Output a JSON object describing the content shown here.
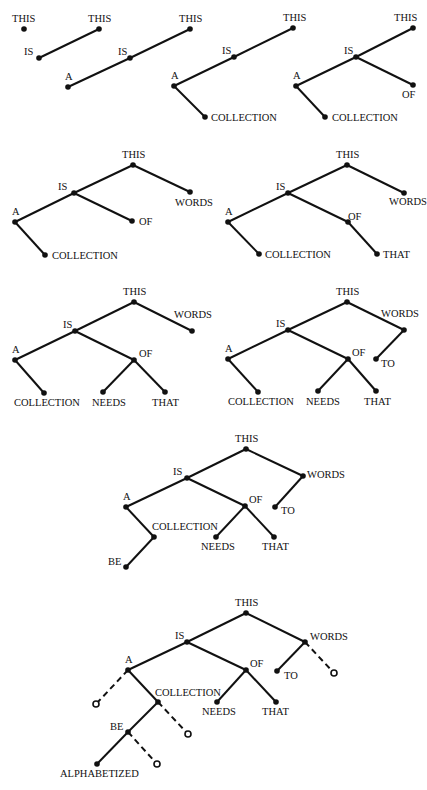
{
  "figure": {
    "trees": [
      {
        "nodes": [
          {
            "id": "THIS",
            "label": "THIS",
            "x": 24,
            "y": 29,
            "lx": 12,
            "ly": 22
          }
        ],
        "edges": []
      },
      {
        "nodes": [
          {
            "id": "THIS",
            "label": "THIS",
            "x": 99,
            "y": 29,
            "lx": 88,
            "ly": 22
          },
          {
            "id": "IS",
            "label": "IS",
            "x": 39,
            "y": 58,
            "lx": 24,
            "ly": 55
          }
        ],
        "edges": [
          [
            "THIS",
            "IS"
          ]
        ]
      },
      {
        "nodes": [
          {
            "id": "THIS",
            "label": "THIS",
            "x": 190,
            "y": 29,
            "lx": 179,
            "ly": 22
          },
          {
            "id": "IS",
            "label": "IS",
            "x": 130,
            "y": 58,
            "lx": 118,
            "ly": 55
          },
          {
            "id": "A",
            "label": "A",
            "x": 68,
            "y": 87,
            "lx": 65,
            "ly": 80
          }
        ],
        "edges": [
          [
            "THIS",
            "IS"
          ],
          [
            "IS",
            "A"
          ]
        ]
      },
      {
        "nodes": [
          {
            "id": "THIS",
            "label": "THIS",
            "x": 293,
            "y": 28,
            "lx": 283,
            "ly": 21
          },
          {
            "id": "IS",
            "label": "IS",
            "x": 234,
            "y": 57,
            "lx": 222,
            "ly": 54
          },
          {
            "id": "A",
            "label": "A",
            "x": 174,
            "y": 86,
            "lx": 171,
            "ly": 79
          },
          {
            "id": "COLLECTION",
            "label": "COLLECTION",
            "x": 205,
            "y": 117,
            "lx": 211,
            "ly": 121
          }
        ],
        "edges": [
          [
            "THIS",
            "IS"
          ],
          [
            "IS",
            "A"
          ],
          [
            "A",
            "COLLECTION"
          ]
        ]
      },
      {
        "nodes": [
          {
            "id": "THIS",
            "label": "THIS",
            "x": 413,
            "y": 28,
            "lx": 394,
            "ly": 21
          },
          {
            "id": "IS",
            "label": "IS",
            "x": 356,
            "y": 57,
            "lx": 344,
            "ly": 54
          },
          {
            "id": "A",
            "label": "A",
            "x": 296,
            "y": 86,
            "lx": 293,
            "ly": 79
          },
          {
            "id": "OF",
            "label": "OF",
            "x": 413,
            "y": 85,
            "lx": 402,
            "ly": 98
          },
          {
            "id": "COLLECTION",
            "label": "COLLECTION",
            "x": 325,
            "y": 117,
            "lx": 332,
            "ly": 121
          }
        ],
        "edges": [
          [
            "THIS",
            "IS"
          ],
          [
            "IS",
            "A"
          ],
          [
            "IS",
            "OF"
          ],
          [
            "A",
            "COLLECTION"
          ]
        ]
      },
      {
        "nodes": [
          {
            "id": "THIS",
            "label": "THIS",
            "x": 133,
            "y": 165,
            "lx": 122,
            "ly": 158
          },
          {
            "id": "IS",
            "label": "IS",
            "x": 74,
            "y": 193,
            "lx": 58,
            "ly": 190
          },
          {
            "id": "A",
            "label": "A",
            "x": 15,
            "y": 222,
            "lx": 12,
            "ly": 215
          },
          {
            "id": "OF",
            "label": "OF",
            "x": 132,
            "y": 221,
            "lx": 139,
            "ly": 225
          },
          {
            "id": "WORDS",
            "label": "WORDS",
            "x": 190,
            "y": 192,
            "lx": 175,
            "ly": 206
          },
          {
            "id": "COLLECTION",
            "label": "COLLECTION",
            "x": 45,
            "y": 255,
            "lx": 52,
            "ly": 259
          }
        ],
        "edges": [
          [
            "THIS",
            "IS"
          ],
          [
            "THIS",
            "WORDS"
          ],
          [
            "IS",
            "A"
          ],
          [
            "IS",
            "OF"
          ],
          [
            "A",
            "COLLECTION"
          ]
        ]
      },
      {
        "nodes": [
          {
            "id": "THIS",
            "label": "THIS",
            "x": 347,
            "y": 165,
            "lx": 336,
            "ly": 158
          },
          {
            "id": "IS",
            "label": "IS",
            "x": 288,
            "y": 193,
            "lx": 276,
            "ly": 190
          },
          {
            "id": "A",
            "label": "A",
            "x": 228,
            "y": 222,
            "lx": 225,
            "ly": 215
          },
          {
            "id": "OF",
            "label": "OF",
            "x": 348,
            "y": 222,
            "lx": 348,
            "ly": 220
          },
          {
            "id": "WORDS",
            "label": "WORDS",
            "x": 404,
            "y": 193,
            "lx": 389,
            "ly": 205
          },
          {
            "id": "COLLECTION",
            "label": "COLLECTION",
            "x": 259,
            "y": 254,
            "lx": 265,
            "ly": 258
          },
          {
            "id": "THAT",
            "label": "THAT",
            "x": 377,
            "y": 254,
            "lx": 383,
            "ly": 258
          }
        ],
        "edges": [
          [
            "THIS",
            "IS"
          ],
          [
            "THIS",
            "WORDS"
          ],
          [
            "IS",
            "A"
          ],
          [
            "IS",
            "OF"
          ],
          [
            "A",
            "COLLECTION"
          ],
          [
            "OF",
            "THAT"
          ]
        ]
      },
      {
        "nodes": [
          {
            "id": "THIS",
            "label": "THIS",
            "x": 134,
            "y": 302,
            "lx": 123,
            "ly": 295
          },
          {
            "id": "IS",
            "label": "IS",
            "x": 75,
            "y": 331,
            "lx": 63,
            "ly": 328
          },
          {
            "id": "A",
            "label": "A",
            "x": 15,
            "y": 360,
            "lx": 12,
            "ly": 353
          },
          {
            "id": "OF",
            "label": "OF",
            "x": 134,
            "y": 360,
            "lx": 139,
            "ly": 357
          },
          {
            "id": "WORDS",
            "label": "WORDS",
            "x": 192,
            "y": 331,
            "lx": 174,
            "ly": 318
          },
          {
            "id": "COLLECTION",
            "label": "COLLECTION",
            "x": 44,
            "y": 393,
            "lx": 14,
            "ly": 406
          },
          {
            "id": "NEEDS",
            "label": "NEEDS",
            "x": 103,
            "y": 392,
            "lx": 92,
            "ly": 406
          },
          {
            "id": "THAT",
            "label": "THAT",
            "x": 165,
            "y": 392,
            "lx": 152,
            "ly": 406
          }
        ],
        "edges": [
          [
            "THIS",
            "IS"
          ],
          [
            "THIS",
            "WORDS"
          ],
          [
            "IS",
            "A"
          ],
          [
            "IS",
            "OF"
          ],
          [
            "A",
            "COLLECTION"
          ],
          [
            "OF",
            "NEEDS"
          ],
          [
            "OF",
            "THAT"
          ]
        ]
      },
      {
        "nodes": [
          {
            "id": "THIS",
            "label": "THIS",
            "x": 347,
            "y": 302,
            "lx": 336,
            "ly": 295
          },
          {
            "id": "IS",
            "label": "IS",
            "x": 288,
            "y": 330,
            "lx": 276,
            "ly": 327
          },
          {
            "id": "A",
            "label": "A",
            "x": 228,
            "y": 359,
            "lx": 225,
            "ly": 352
          },
          {
            "id": "OF",
            "label": "OF",
            "x": 348,
            "y": 359,
            "lx": 352,
            "ly": 356
          },
          {
            "id": "WORDS",
            "label": "WORDS",
            "x": 404,
            "y": 330,
            "lx": 381,
            "ly": 317
          },
          {
            "id": "TO",
            "label": "TO",
            "x": 376,
            "y": 359,
            "lx": 381,
            "ly": 367
          },
          {
            "id": "COLLECTION",
            "label": "COLLECTION",
            "x": 258,
            "y": 392,
            "lx": 228,
            "ly": 405
          },
          {
            "id": "NEEDS",
            "label": "NEEDS",
            "x": 318,
            "y": 391,
            "lx": 306,
            "ly": 405
          },
          {
            "id": "THAT",
            "label": "THAT",
            "x": 376,
            "y": 391,
            "lx": 364,
            "ly": 405
          }
        ],
        "edges": [
          [
            "THIS",
            "IS"
          ],
          [
            "THIS",
            "WORDS"
          ],
          [
            "IS",
            "A"
          ],
          [
            "IS",
            "OF"
          ],
          [
            "WORDS",
            "TO"
          ],
          [
            "A",
            "COLLECTION"
          ],
          [
            "OF",
            "NEEDS"
          ],
          [
            "OF",
            "THAT"
          ]
        ]
      },
      {
        "nodes": [
          {
            "id": "THIS",
            "label": "THIS",
            "x": 246,
            "y": 449,
            "lx": 235,
            "ly": 442
          },
          {
            "id": "IS",
            "label": "IS",
            "x": 187,
            "y": 478,
            "lx": 173,
            "ly": 475
          },
          {
            "id": "A",
            "label": "A",
            "x": 126,
            "y": 507,
            "lx": 123,
            "ly": 500
          },
          {
            "id": "OF",
            "label": "OF",
            "x": 245,
            "y": 506,
            "lx": 249,
            "ly": 503
          },
          {
            "id": "WORDS",
            "label": "WORDS",
            "x": 303,
            "y": 476,
            "lx": 307,
            "ly": 478
          },
          {
            "id": "TO",
            "label": "TO",
            "x": 275,
            "y": 507,
            "lx": 281,
            "ly": 514
          },
          {
            "id": "COLLECTION",
            "label": "COLLECTION",
            "x": 154,
            "y": 537,
            "lx": 152,
            "ly": 530
          },
          {
            "id": "NEEDS",
            "label": "NEEDS",
            "x": 216,
            "y": 537,
            "lx": 201,
            "ly": 550
          },
          {
            "id": "THAT",
            "label": "THAT",
            "x": 274,
            "y": 537,
            "lx": 262,
            "ly": 550
          },
          {
            "id": "BE",
            "label": "BE",
            "x": 126,
            "y": 567,
            "lx": 108,
            "ly": 565
          }
        ],
        "edges": [
          [
            "THIS",
            "IS"
          ],
          [
            "THIS",
            "WORDS"
          ],
          [
            "IS",
            "A"
          ],
          [
            "IS",
            "OF"
          ],
          [
            "WORDS",
            "TO"
          ],
          [
            "A",
            "COLLECTION"
          ],
          [
            "OF",
            "NEEDS"
          ],
          [
            "OF",
            "THAT"
          ],
          [
            "COLLECTION",
            "BE"
          ]
        ]
      },
      {
        "nodes": [
          {
            "id": "THIS",
            "label": "THIS",
            "x": 246,
            "y": 613,
            "lx": 235,
            "ly": 606
          },
          {
            "id": "IS",
            "label": "IS",
            "x": 187,
            "y": 642,
            "lx": 175,
            "ly": 639
          },
          {
            "id": "A",
            "label": "A",
            "x": 128,
            "y": 670,
            "lx": 125,
            "ly": 663
          },
          {
            "id": "OF",
            "label": "OF",
            "x": 246,
            "y": 670,
            "lx": 250,
            "ly": 667
          },
          {
            "id": "WORDS",
            "label": "WORDS",
            "x": 305,
            "y": 642,
            "lx": 310,
            "ly": 640
          },
          {
            "id": "TO",
            "label": "TO",
            "x": 277,
            "y": 671,
            "lx": 284,
            "ly": 679
          },
          {
            "id": "COLLECTION",
            "label": "COLLECTION",
            "x": 158,
            "y": 702,
            "lx": 155,
            "ly": 696
          },
          {
            "id": "NEEDS",
            "label": "NEEDS",
            "x": 217,
            "y": 702,
            "lx": 202,
            "ly": 715
          },
          {
            "id": "THAT",
            "label": "THAT",
            "x": 276,
            "y": 702,
            "lx": 262,
            "ly": 715
          },
          {
            "id": "BE",
            "label": "BE",
            "x": 128,
            "y": 732,
            "lx": 110,
            "ly": 730
          },
          {
            "id": "ALPHABETIZED",
            "label": "ALPHABETIZED",
            "x": 97,
            "y": 764,
            "lx": 60,
            "ly": 777
          }
        ],
        "empty_slots": [
          {
            "x": 96,
            "y": 704,
            "from": "A"
          },
          {
            "x": 188,
            "y": 734,
            "from": "COLLECTION"
          },
          {
            "x": 157,
            "y": 764,
            "from": "BE"
          },
          {
            "x": 334,
            "y": 673,
            "from": "WORDS"
          }
        ],
        "edges": [
          [
            "THIS",
            "IS"
          ],
          [
            "THIS",
            "WORDS"
          ],
          [
            "IS",
            "A"
          ],
          [
            "IS",
            "OF"
          ],
          [
            "WORDS",
            "TO"
          ],
          [
            "A",
            "COLLECTION"
          ],
          [
            "OF",
            "NEEDS"
          ],
          [
            "OF",
            "THAT"
          ],
          [
            "COLLECTION",
            "BE"
          ],
          [
            "BE",
            "ALPHABETIZED"
          ]
        ]
      }
    ],
    "colors": {
      "ink": "#111111",
      "background": "#ffffff"
    }
  }
}
